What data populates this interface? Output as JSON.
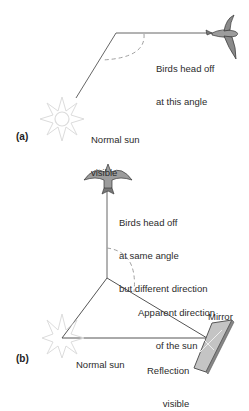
{
  "panels": [
    {
      "id": "a",
      "panel_label": "(a)",
      "bird_caption": [
        "Birds head off",
        "at this angle"
      ],
      "sun_caption": [
        "Normal sun",
        "visible"
      ]
    },
    {
      "id": "b",
      "panel_label": "(b)",
      "bird_caption": [
        "Birds head off",
        "at same angle",
        "but different direction"
      ],
      "apparent_caption": [
        "Apparent direction",
        "of the sun"
      ],
      "mirror_label": "Mirror",
      "reflection_caption": [
        "Reflection",
        "visible"
      ],
      "sun_caption": "Normal sun"
    }
  ],
  "colors": {
    "line": "#555555",
    "dashed_arc": "#9a9a9a",
    "sun_stroke": "#d8d8d8",
    "bird_fill": "#9a9a9a",
    "mirror_fill": "#b5b5b5"
  }
}
